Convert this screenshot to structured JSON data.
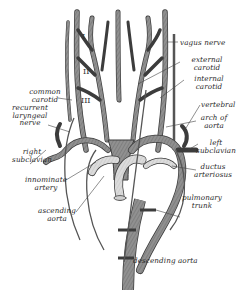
{
  "figure": {
    "colors": {
      "vessel_fill": "#8c8c8c",
      "vessel_stroke": "#3c3c3c",
      "pulmonary_fill": "#d8d8d8",
      "nerve": "#555555",
      "leader": "#444444",
      "text": "#2a2a2a",
      "background": "#ffffff"
    },
    "arch_numerals": [
      "I",
      "II",
      "III"
    ],
    "labels": {
      "vagus_nerve": "vagus nerve",
      "external_carotid_1": "external",
      "external_carotid_2": "carotid",
      "internal_carotid_1": "internal",
      "internal_carotid_2": "carotid",
      "common_carotid_1": "common",
      "common_carotid_2": "carotid",
      "vertebral": "vertebral",
      "recurrent_laryngeal_1": "recurrent",
      "recurrent_laryngeal_2": "laryngeal",
      "recurrent_laryngeal_3": "nerve",
      "arch_of_aorta_1": "arch of",
      "arch_of_aorta_2": "aorta",
      "right_subclavian_1": "right",
      "right_subclavian_2": "subclavian",
      "left_subclavian_1": "left",
      "left_subclavian_2": "subclavian",
      "ductus_arteriosus_1": "ductus",
      "ductus_arteriosus_2": "arteriosus",
      "innominate_artery_1": "innominate",
      "innominate_artery_2": "artery",
      "pulmonary_trunk_1": "pulmonary",
      "pulmonary_trunk_2": "trunk",
      "ascending_aorta_1": "ascending",
      "ascending_aorta_2": "aorta",
      "descending_aorta": "descending aorta"
    }
  }
}
